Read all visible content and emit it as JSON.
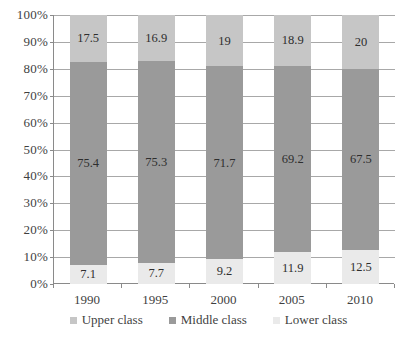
{
  "chart_data": {
    "type": "bar",
    "subtype": "stacked-percent",
    "title": "",
    "subtitle": "",
    "xlabel": "",
    "ylabel": "",
    "categories": [
      "1990",
      "1995",
      "2000",
      "2005",
      "2010"
    ],
    "ylim": [
      0,
      100
    ],
    "y_ticks": [
      "0%",
      "10%",
      "20%",
      "30%",
      "40%",
      "50%",
      "60%",
      "70%",
      "80%",
      "90%",
      "100%"
    ],
    "y_tick_values": [
      0,
      10,
      20,
      30,
      40,
      50,
      60,
      70,
      80,
      90,
      100
    ],
    "grid": true,
    "legend_position": "bottom",
    "series": [
      {
        "name": "Upper class",
        "color": "#c6c6c6",
        "values": [
          17.5,
          16.9,
          19,
          18.9,
          20
        ],
        "labels": [
          "17.5",
          "16.9",
          "19",
          "18.9",
          "20"
        ]
      },
      {
        "name": "Middle class",
        "color": "#9a9a9a",
        "values": [
          75.4,
          75.3,
          71.7,
          69.2,
          67.5
        ],
        "labels": [
          "75.4",
          "75.3",
          "71.7",
          "69.2",
          "67.5"
        ]
      },
      {
        "name": "Lower class",
        "color": "#eaeaea",
        "values": [
          7.1,
          7.7,
          9.2,
          11.9,
          12.5
        ],
        "labels": [
          "7.1",
          "7.7",
          "9.2",
          "11.9",
          "12.5"
        ]
      }
    ],
    "stack_order_bottom_to_top": [
      "Lower class",
      "Middle class",
      "Upper class"
    ]
  },
  "legend": {
    "items": [
      {
        "label": "Upper class",
        "color": "#c6c6c6"
      },
      {
        "label": "Middle class",
        "color": "#9a9a9a"
      },
      {
        "label": "Lower class",
        "color": "#eaeaea"
      }
    ]
  },
  "colors": {
    "axis": "#8a8a8a",
    "gridline": "#a8a8a8",
    "text": "#3f3f3f",
    "label_text": "#2e2e2e",
    "background": "#ffffff"
  }
}
